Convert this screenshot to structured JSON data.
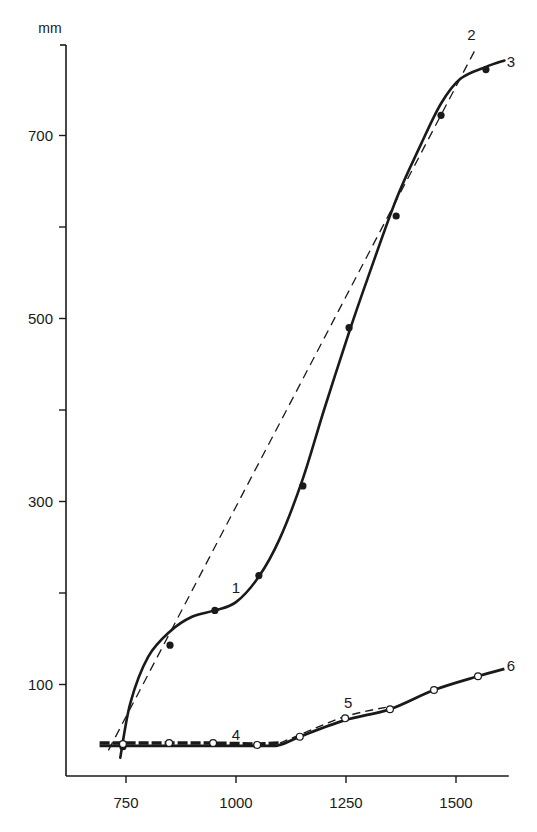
{
  "chart_data": {
    "type": "line",
    "title": "",
    "xlabel": "",
    "ylabel": "mm",
    "xlim": [
      680,
      1620
    ],
    "ylim": [
      0,
      800
    ],
    "grid": false,
    "x_ticks": [
      750,
      1000,
      1250,
      1500
    ],
    "y_ticks": [
      100,
      200,
      300,
      400,
      500,
      600,
      700
    ],
    "y_tick_labels": [
      "100",
      "",
      "300",
      "",
      "500",
      "",
      "700"
    ],
    "series": [
      {
        "name": "1",
        "style": "solid-thick",
        "marker": "filled-circle",
        "points": [
          [
            743,
            32
          ],
          [
            850,
            143
          ],
          [
            952,
            181
          ],
          [
            1052,
            219
          ],
          [
            1152,
            317
          ],
          [
            1257,
            490
          ],
          [
            1364,
            612
          ],
          [
            1466,
            722
          ],
          [
            1568,
            772
          ]
        ]
      },
      {
        "name": "2",
        "style": "dashed",
        "marker": "none",
        "points": [
          [
            710,
            28
          ],
          [
            1545,
            795
          ]
        ]
      },
      {
        "name": "3",
        "style": "solid-thick",
        "marker": "none",
        "curve": [
          [
            737,
            20
          ],
          [
            760,
            80
          ],
          [
            800,
            130
          ],
          [
            850,
            158
          ],
          [
            900,
            174
          ],
          [
            952,
            181
          ],
          [
            1000,
            190
          ],
          [
            1052,
            218
          ],
          [
            1100,
            260
          ],
          [
            1152,
            325
          ],
          [
            1200,
            400
          ],
          [
            1257,
            485
          ],
          [
            1300,
            545
          ],
          [
            1364,
            630
          ],
          [
            1420,
            690
          ],
          [
            1466,
            735
          ],
          [
            1510,
            762
          ],
          [
            1568,
            775
          ],
          [
            1610,
            782
          ]
        ]
      },
      {
        "name": "4",
        "style": "dashed-thick",
        "marker": "open-circle",
        "points": [
          [
            690,
            36
          ],
          [
            743,
            36
          ],
          [
            848,
            36
          ],
          [
            948,
            36
          ],
          [
            1048,
            35
          ],
          [
            1100,
            36
          ]
        ]
      },
      {
        "name": "5",
        "style": "dashed",
        "marker": "open-circle",
        "points": [
          [
            1100,
            36
          ],
          [
            1145,
            45
          ],
          [
            1248,
            65
          ],
          [
            1350,
            76
          ]
        ]
      },
      {
        "name": "6",
        "style": "solid-thick",
        "marker": "open-circle",
        "points": [
          [
            690,
            33
          ],
          [
            1048,
            33
          ],
          [
            1100,
            34
          ],
          [
            1145,
            43
          ],
          [
            1248,
            61
          ],
          [
            1350,
            73
          ],
          [
            1450,
            94
          ],
          [
            1550,
            109
          ],
          [
            1610,
            117
          ]
        ]
      }
    ],
    "annotations": [
      {
        "text": "1",
        "x": 1000,
        "y": 205
      },
      {
        "text": "2",
        "x": 1535,
        "y": 810
      },
      {
        "text": "3",
        "x": 1625,
        "y": 780
      },
      {
        "text": "4",
        "x": 1000,
        "y": 45
      },
      {
        "text": "5",
        "x": 1255,
        "y": 80
      },
      {
        "text": "6",
        "x": 1625,
        "y": 120
      }
    ]
  }
}
